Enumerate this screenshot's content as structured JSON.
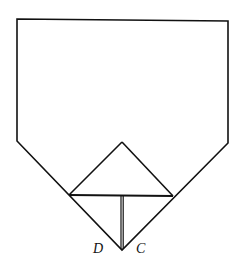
{
  "diagram": {
    "type": "folding-figure",
    "stroke_color": "#111111",
    "background": "#ffffff",
    "outer_pentagon": {
      "points": [
        [
          17,
          19
        ],
        [
          228,
          21
        ],
        [
          228,
          143
        ],
        [
          122,
          250
        ],
        [
          17,
          141
        ]
      ]
    },
    "inner_triangle": {
      "apex": [
        122,
        142
      ],
      "base_left": [
        69,
        195
      ],
      "base_right": [
        173,
        196
      ]
    },
    "fold_line": {
      "top": [
        122,
        196
      ],
      "bottom": [
        122,
        250
      ],
      "style": "double"
    },
    "labels": [
      {
        "id": "D",
        "text": "D",
        "position": [
          100,
          249
        ]
      },
      {
        "id": "C",
        "text": "C",
        "position": [
          142,
          249
        ]
      }
    ]
  }
}
